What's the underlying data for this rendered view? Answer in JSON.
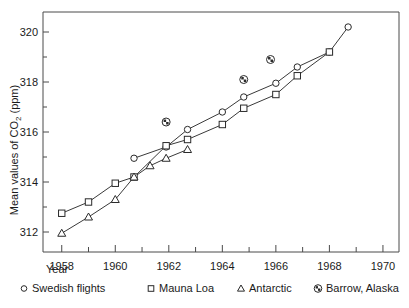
{
  "chart_data": {
    "type": "line",
    "title": "",
    "xlabel": "Year",
    "ylabel": "Mean values of CO2 (ppm)",
    "ylabel_parts": {
      "prefix": "Mean values of CO",
      "sub": "2",
      "suffix": " (ppm)"
    },
    "xlim": [
      1957.3,
      1970.6
    ],
    "ylim": [
      311.2,
      320.8
    ],
    "grid": false,
    "legend_position": "below-axis",
    "x_ticks": [
      1958,
      1959,
      1960,
      1961,
      1962,
      1963,
      1964,
      1965,
      1966,
      1967,
      1968,
      1969,
      1970
    ],
    "x_tick_labels": [
      "1958",
      "",
      "1960",
      "",
      "1962",
      "",
      "1964",
      "",
      "1966",
      "",
      "1968",
      "",
      "1970"
    ],
    "y_ticks": [
      312,
      313,
      314,
      315,
      316,
      317,
      318,
      319,
      320
    ],
    "y_tick_labels": [
      "312",
      "",
      "314",
      "",
      "316",
      "",
      "318",
      "",
      "320"
    ],
    "series": [
      {
        "name": "Swedish flights",
        "marker": "circle",
        "connected": true,
        "points": [
          {
            "x": 1960.7,
            "y": 314.95
          },
          {
            "x": 1961.9,
            "y": 315.4
          },
          {
            "x": 1962.7,
            "y": 316.1
          },
          {
            "x": 1964.0,
            "y": 316.8
          },
          {
            "x": 1964.8,
            "y": 317.4
          },
          {
            "x": 1966.0,
            "y": 317.95
          },
          {
            "x": 1966.8,
            "y": 318.6
          },
          {
            "x": 1968.0,
            "y": 319.2
          },
          {
            "x": 1968.7,
            "y": 320.2
          }
        ]
      },
      {
        "name": "Mauna Loa",
        "marker": "square",
        "connected": true,
        "points": [
          {
            "x": 1958.0,
            "y": 312.75
          },
          {
            "x": 1959.0,
            "y": 313.2
          },
          {
            "x": 1960.0,
            "y": 313.95
          },
          {
            "x": 1960.7,
            "y": 314.2
          },
          {
            "x": 1961.9,
            "y": 315.45
          },
          {
            "x": 1962.7,
            "y": 315.7
          },
          {
            "x": 1964.0,
            "y": 316.3
          },
          {
            "x": 1964.8,
            "y": 316.95
          },
          {
            "x": 1966.0,
            "y": 317.5
          },
          {
            "x": 1966.8,
            "y": 318.25
          },
          {
            "x": 1968.0,
            "y": 319.2
          }
        ]
      },
      {
        "name": "Antarctic",
        "marker": "triangle",
        "connected": true,
        "points": [
          {
            "x": 1958.0,
            "y": 311.95
          },
          {
            "x": 1959.0,
            "y": 312.6
          },
          {
            "x": 1960.0,
            "y": 313.3
          },
          {
            "x": 1960.7,
            "y": 314.2
          },
          {
            "x": 1961.3,
            "y": 314.65
          },
          {
            "x": 1961.9,
            "y": 314.95
          },
          {
            "x": 1962.7,
            "y": 315.3
          }
        ]
      },
      {
        "name": "Barrow, Alaska",
        "marker": "crossed-circle",
        "connected": false,
        "points": [
          {
            "x": 1961.9,
            "y": 316.4
          },
          {
            "x": 1964.8,
            "y": 318.1
          },
          {
            "x": 1965.8,
            "y": 318.9
          }
        ]
      }
    ]
  },
  "legend": {
    "items": [
      {
        "label": "Swedish flights",
        "marker": "circle"
      },
      {
        "label": "Mauna Loa",
        "marker": "square"
      },
      {
        "label": "Antarctic",
        "marker": "triangle"
      },
      {
        "label": "Barrow, Alaska",
        "marker": "crossed-circle"
      }
    ]
  }
}
